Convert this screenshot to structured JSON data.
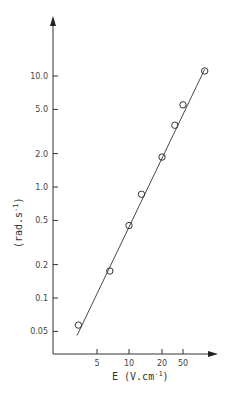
{
  "chart_data": {
    "type": "scatter",
    "title": "",
    "xlabel": "E (V.cm⁻¹)",
    "ylabel": "(rad.s⁻¹)",
    "x_scale": "log",
    "y_scale": "log",
    "x_tick_labels": [
      "5",
      "10",
      "20",
      "50"
    ],
    "y_tick_labels": [
      "0.05",
      "0.1",
      "0.2",
      "0.5",
      "1.0",
      "2.0",
      "5.0",
      "10.0"
    ],
    "grid": false,
    "legend": null,
    "series": [
      {
        "name": "measured",
        "marker": "open-circle",
        "x": [
          3.3,
          6.6,
          10,
          13,
          20,
          35,
          50,
          80
        ],
        "y": [
          0.057,
          0.175,
          0.45,
          0.86,
          1.86,
          3.6,
          5.5,
          11.1
        ]
      },
      {
        "name": "fit",
        "marker": "line",
        "x": [
          3.2,
          80
        ],
        "y": [
          0.046,
          11.5
        ]
      }
    ]
  },
  "axes": {
    "x_label_prefix": "E",
    "x_label_units": "(V.cm",
    "x_label_exp": "-1",
    "x_label_close": ")",
    "y_label_text": "(rad.s",
    "y_label_exp": "-1",
    "y_label_close": ")"
  }
}
